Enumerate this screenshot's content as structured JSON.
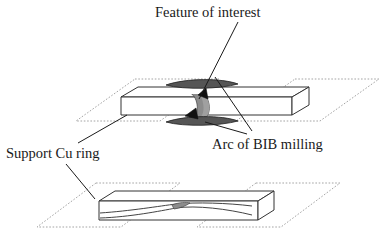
{
  "figure": {
    "title_label": "Feature of interest",
    "arc_label": "Arc of BIB milling",
    "support_label": "Support Cu ring",
    "colors": {
      "outline": "#1a1a1a",
      "plate_dotted": "#9a9a9a",
      "wedge_fill": "#8c8c8c",
      "wedge_fill_light": "#a8a8a8",
      "arrow_fill": "#111111",
      "arc_fill": "#555555",
      "background": "#ffffff"
    },
    "assemblies": [
      {
        "name": "upper-assembly",
        "description": "slab with BIB milling arcs above and below",
        "has_arcs": true,
        "arc_count": 2,
        "arrow_count": 2
      },
      {
        "name": "lower-assembly",
        "description": "slab with thinned lamella wedge",
        "has_arcs": false,
        "arc_count": 0,
        "arrow_count": 1
      }
    ],
    "leaders": [
      {
        "name": "feature-leader",
        "from_label": "Feature of interest",
        "to": "wedge-upper"
      },
      {
        "name": "arc-leader",
        "from_label": "Arc of BIB milling",
        "to": "arc-lower"
      },
      {
        "name": "support-leader-upper",
        "from_label": "Support Cu ring",
        "to": "plate-upper-left"
      },
      {
        "name": "support-leader-lower",
        "from_label": "Support Cu ring",
        "to": "plate-lower-left"
      }
    ]
  }
}
